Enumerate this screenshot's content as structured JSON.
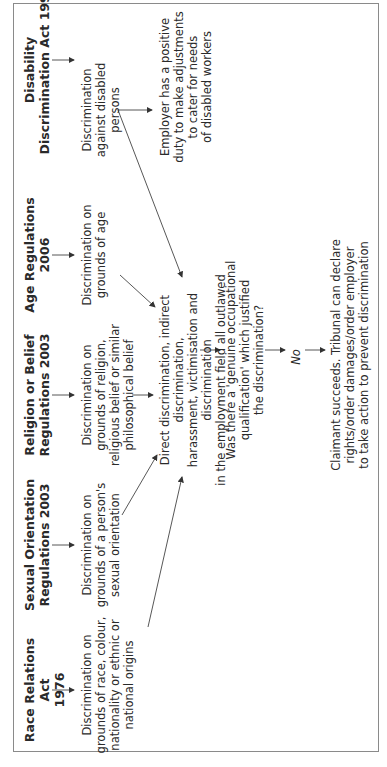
{
  "diagram": {
    "orientation": "rotated 90 degrees counter-clockwise",
    "sources": [
      {
        "heading": "Race Relations Act\n1976",
        "description": "Discrimination on\ngrounds of race, colour,\nnationality or ethnic or\nnational origins"
      },
      {
        "heading": "Sexual Orientation\nRegulations 2003",
        "description": "Discrimination on\ngrounds of a person's\nsexual orientation"
      },
      {
        "heading": "Religion or Belief\nRegulations 2003",
        "description": "Discrimination on\ngrounds of religion,\nreligious belief or similar\nphilosophical belief"
      },
      {
        "heading": "Age Regulations\n2006",
        "description": "Discrimination on\ngrounds of age"
      },
      {
        "heading": "Disability\nDiscrimination Act 1995",
        "description": "Discrimination\nagainst disabled\npersons"
      }
    ],
    "disability_extra": "Employer has a positive\nduty to make adjustments\nto cater for needs\nof disabled workers",
    "outlawed": "Direct discrimination, indirect discrimination,\nharassment, victimisation and discrimination\nin the employment field all outlawed",
    "question": "Was there a 'genuine occupational\nqualification' which justified\nthe discrimination?",
    "answer": "No",
    "outcome": "Claimant succeeds. Tribunal can declare\nrights/order damages/order employer\nto take action to prevent discrimination",
    "colors": {
      "text": "#2a2a2a",
      "border": "#8a8a8a",
      "lines": "#444444"
    }
  }
}
